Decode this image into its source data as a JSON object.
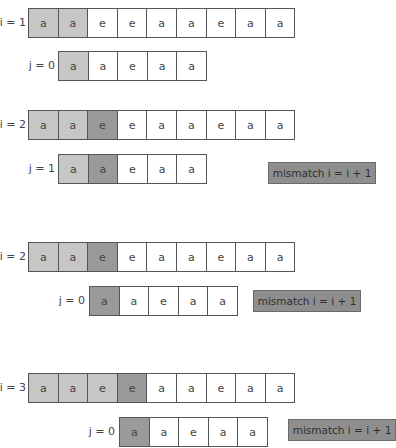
{
  "colors": {
    "light": "#c6c6c6",
    "dark": "#9a9a9a",
    "mismatch_bg": "#8e8e8e",
    "border": "#555555"
  },
  "steps": [
    {
      "text_label": "i = 1",
      "text": [
        "a",
        "a",
        "e",
        "e",
        "a",
        "a",
        "e",
        "a",
        "a"
      ],
      "text_shade": [
        "light",
        "light",
        "",
        "",
        "",
        "",
        "",
        "",
        ""
      ],
      "pattern_label": "j = 0",
      "pattern": [
        "a",
        "a",
        "e",
        "a",
        "a"
      ],
      "pattern_shade": [
        "light",
        "",
        "",
        "",
        ""
      ],
      "note": ""
    },
    {
      "text_label": "i = 2",
      "text": [
        "a",
        "a",
        "e",
        "e",
        "a",
        "a",
        "e",
        "a",
        "a"
      ],
      "text_shade": [
        "light",
        "light",
        "dark",
        "",
        "",
        "",
        "",
        "",
        ""
      ],
      "pattern_label": "j = 1",
      "pattern": [
        "a",
        "a",
        "e",
        "a",
        "a"
      ],
      "pattern_shade": [
        "light",
        "dark",
        "",
        "",
        ""
      ],
      "note": "mismatch i = i + 1"
    },
    {
      "text_label": "i = 2",
      "text": [
        "a",
        "a",
        "e",
        "e",
        "a",
        "a",
        "e",
        "a",
        "a"
      ],
      "text_shade": [
        "light",
        "light",
        "dark",
        "",
        "",
        "",
        "",
        "",
        ""
      ],
      "pattern_label": "j = 0",
      "pattern": [
        "a",
        "a",
        "e",
        "a",
        "a"
      ],
      "pattern_shade": [
        "dark",
        "",
        "",
        "",
        ""
      ],
      "note": "mismatch i = i + 1"
    },
    {
      "text_label": "i = 3",
      "text": [
        "a",
        "a",
        "e",
        "e",
        "a",
        "a",
        "e",
        "a",
        "a"
      ],
      "text_shade": [
        "light",
        "light",
        "light",
        "dark",
        "",
        "",
        "",
        "",
        ""
      ],
      "pattern_label": "j = 0",
      "pattern": [
        "a",
        "a",
        "e",
        "a",
        "a"
      ],
      "pattern_shade": [
        "dark",
        "",
        "",
        "",
        ""
      ],
      "note": "mismatch i = i + 1"
    }
  ]
}
